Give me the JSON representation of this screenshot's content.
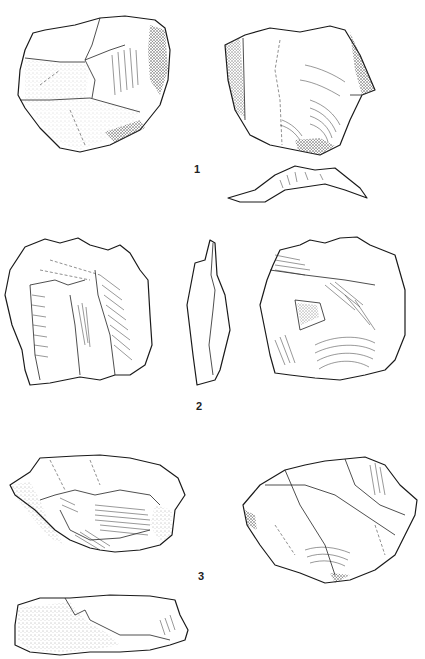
{
  "plate": {
    "background": "#ffffff",
    "ink_color": "#1a1a1a",
    "figures": [
      {
        "number": "1",
        "label": "1",
        "views": [
          "dorsal-face",
          "ventral-face",
          "profile-bottom"
        ]
      },
      {
        "number": "2",
        "label": "2",
        "views": [
          "dorsal-face",
          "lateral-profile",
          "ventral-face"
        ]
      },
      {
        "number": "3",
        "label": "3",
        "views": [
          "dorsal-face",
          "ventral-face",
          "profile-bottom"
        ]
      }
    ]
  }
}
